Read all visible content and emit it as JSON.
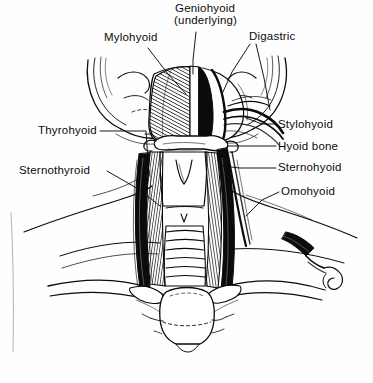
{
  "figure": {
    "style": "pen-and-ink anatomical line drawing",
    "ink_color": "#0b0b0b",
    "background_color": "#fefefe"
  },
  "labels": [
    {
      "id": "mylohyoid",
      "text": "Mylohyoid",
      "x": 104,
      "y": 37,
      "align": "left"
    },
    {
      "id": "geniohyoid",
      "text": "Geniohyoid",
      "x": 175,
      "y": 8,
      "align": "left"
    },
    {
      "id": "geniohyoid2",
      "text": "(underlying)",
      "x": 174,
      "y": 20,
      "align": "left"
    },
    {
      "id": "digastric",
      "text": "Digastric",
      "x": 249,
      "y": 36,
      "align": "left"
    },
    {
      "id": "thyrohyoid",
      "text": "Thyrohyoid",
      "x": 38,
      "y": 126,
      "align": "left"
    },
    {
      "id": "sternothyroid",
      "text": "Sternothyroid",
      "x": 19,
      "y": 166,
      "align": "left"
    },
    {
      "id": "stylohyoid",
      "text": "Stylohyoid",
      "x": 278,
      "y": 119,
      "align": "left"
    },
    {
      "id": "hyoid-bone",
      "text": "Hyoid bone",
      "x": 278,
      "y": 141,
      "align": "left"
    },
    {
      "id": "sternohyoid",
      "text": "Sternohyoid",
      "x": 278,
      "y": 163,
      "align": "left"
    },
    {
      "id": "omohyoid",
      "text": "Omohyoid",
      "x": 281,
      "y": 187,
      "align": "left"
    }
  ],
  "structures": [
    "mandible",
    "hyoid bone",
    "thyroid cartilage",
    "trachea",
    "mylohyoid muscle",
    "digastric muscle",
    "stylohyoid muscle",
    "sternohyoid muscle",
    "sternothyroid muscle",
    "thyrohyoid muscle",
    "omohyoid muscle",
    "clavicle",
    "manubrium of sternum"
  ]
}
